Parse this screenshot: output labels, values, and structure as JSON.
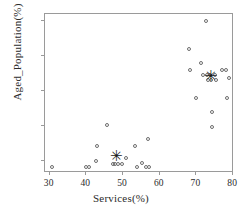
{
  "chart_data": {
    "type": "scatter",
    "title": "",
    "xlabel": "Services(%)",
    "ylabel": "Aged_Population(%)",
    "xlim": [
      29,
      80.5
    ],
    "ylim": [
      3.2,
      25.8
    ],
    "xticks": [
      30,
      40,
      50,
      60,
      70,
      80
    ],
    "yticks": [
      5,
      10,
      15,
      20,
      25
    ],
    "grid": false,
    "legend": "none",
    "series": [
      {
        "name": "observations",
        "marker": "open-circle",
        "points": [
          [
            31.0,
            4.0
          ],
          [
            40.3,
            4.0
          ],
          [
            41.0,
            4.0
          ],
          [
            43.0,
            4.9
          ],
          [
            43.2,
            7.0
          ],
          [
            46.0,
            10.0
          ],
          [
            47.4,
            4.5
          ],
          [
            48.2,
            4.5
          ],
          [
            49.0,
            4.5
          ],
          [
            49.9,
            4.5
          ],
          [
            51.0,
            5.4
          ],
          [
            53.4,
            7.0
          ],
          [
            54.0,
            4.0
          ],
          [
            55.3,
            4.6
          ],
          [
            56.6,
            4.0
          ],
          [
            57.4,
            4.0
          ],
          [
            57.2,
            8.0
          ],
          [
            68.2,
            20.8
          ],
          [
            68.6,
            17.8
          ],
          [
            70.2,
            13.9
          ],
          [
            71.4,
            18.8
          ],
          [
            72.0,
            17.2
          ],
          [
            72.9,
            24.8
          ],
          [
            73.2,
            17.2
          ],
          [
            73.4,
            16.4
          ],
          [
            74.0,
            17.2
          ],
          [
            74.3,
            16.4
          ],
          [
            74.6,
            11.9
          ],
          [
            74.6,
            9.8
          ],
          [
            75.4,
            17.2
          ],
          [
            75.6,
            16.4
          ],
          [
            77.2,
            17.8
          ],
          [
            78.3,
            17.8
          ],
          [
            78.6,
            13.8
          ],
          [
            79.2,
            16.7
          ]
        ]
      },
      {
        "name": "cluster-centers",
        "marker": "star",
        "glyph": "✳",
        "points": [
          [
            48.4,
            5.5
          ],
          [
            74.2,
            16.9
          ]
        ]
      }
    ]
  },
  "colors": {
    "marker_stroke": "#6d6d6d",
    "star": "#1a1a1a",
    "axis": "#9a9a9a",
    "text": "#2b2b2b",
    "background": "#ffffff"
  }
}
